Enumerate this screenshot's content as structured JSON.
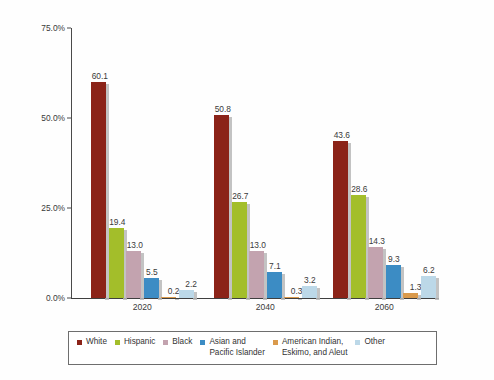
{
  "chart_data": {
    "type": "bar",
    "title": "",
    "subtitle": "",
    "xlabel": "",
    "ylabel": "Percentage of Total Population",
    "categories": [
      "2020",
      "2040",
      "2060"
    ],
    "ylim": [
      0,
      75
    ],
    "ytick_labels": [
      "0.0%",
      "25.0%",
      "50.0%",
      "75.0%"
    ],
    "ytick_values": [
      0,
      25,
      50,
      75
    ],
    "grid": false,
    "legend_position": "bottom",
    "series": [
      {
        "name": "White",
        "color": "#8B2318",
        "values": [
          60.1,
          50.8,
          43.6
        ],
        "labels": [
          "60.1",
          "50.8",
          "43.6"
        ]
      },
      {
        "name": "Hispanic",
        "color": "#A3BE2A",
        "values": [
          19.4,
          26.7,
          28.6
        ],
        "labels": [
          "19.4",
          "26.7",
          "28.6"
        ]
      },
      {
        "name": "Black",
        "color": "#C3A3AF",
        "values": [
          13.0,
          13.0,
          14.3
        ],
        "labels": [
          "13.0",
          "13.0",
          "14.3"
        ]
      },
      {
        "name": "Asian and\nPacific Islander",
        "color": "#3C8CC4",
        "values": [
          5.5,
          7.1,
          9.3
        ],
        "labels": [
          "5.5",
          "7.1",
          "9.3"
        ]
      },
      {
        "name": "American Indian,\nEskimo, and Aleut",
        "color": "#DA9A4C",
        "values": [
          0.2,
          0.3,
          1.3
        ],
        "labels": [
          "0.2",
          "0.3",
          "1.3"
        ]
      },
      {
        "name": "Other",
        "color": "#BCD8E8",
        "values": [
          2.2,
          3.2,
          6.2
        ],
        "labels": [
          "2.2",
          "3.2",
          "6.2"
        ]
      }
    ]
  },
  "legend": {
    "items": [
      {
        "label": "White",
        "color": "#8B2318"
      },
      {
        "label": "Hispanic",
        "color": "#A3BE2A"
      },
      {
        "label": "Black",
        "color": "#C3A3AF"
      },
      {
        "label": "Asian and\nPacific Islander",
        "color": "#3C8CC4"
      },
      {
        "label": "American Indian,\nEskimo, and Aleut",
        "color": "#DA9A4C"
      },
      {
        "label": "Other",
        "color": "#BCD8E8"
      }
    ]
  }
}
